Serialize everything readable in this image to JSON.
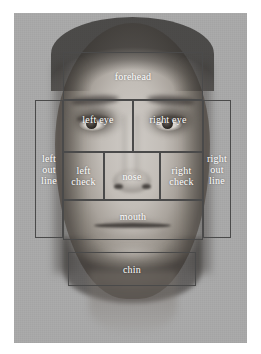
{
  "figure": {
    "name": "face-region-annotation-diagram",
    "background_color": "#a9a9a9",
    "border_color": "#4a4a4a",
    "label_color": "#ffffff"
  },
  "regions": [
    {
      "key": "forehead",
      "label": "forehead",
      "x": 49,
      "y": 39,
      "w": 140,
      "h": 48,
      "align": "mid"
    },
    {
      "key": "left_eye",
      "label": "left eye",
      "x": 49,
      "y": 87,
      "w": 70,
      "h": 52,
      "align": "upper"
    },
    {
      "key": "right_eye",
      "label": "right eye",
      "x": 119,
      "y": 87,
      "w": 70,
      "h": 52,
      "align": "upper"
    },
    {
      "key": "left_outline",
      "label": "left\nout\nline",
      "x": 21,
      "y": 87,
      "w": 28,
      "h": 138,
      "align": "mid"
    },
    {
      "key": "right_outline",
      "label": "right\nout\nline",
      "x": 189,
      "y": 87,
      "w": 28,
      "h": 138,
      "align": "mid"
    },
    {
      "key": "left_cheek",
      "label": "left\ncheck",
      "x": 49,
      "y": 139,
      "w": 41,
      "h": 48,
      "align": "mid"
    },
    {
      "key": "nose",
      "label": "nose",
      "x": 90,
      "y": 139,
      "w": 56,
      "h": 48,
      "align": "mid"
    },
    {
      "key": "right_cheek",
      "label": "right\ncheck",
      "x": 146,
      "y": 139,
      "w": 43,
      "h": 48,
      "align": "mid"
    },
    {
      "key": "mouth",
      "label": "mouth",
      "x": 49,
      "y": 187,
      "w": 140,
      "h": 40,
      "align": "upper"
    },
    {
      "key": "chin",
      "label": "chin",
      "x": 54,
      "y": 239,
      "w": 128,
      "h": 34,
      "align": "mid"
    }
  ]
}
